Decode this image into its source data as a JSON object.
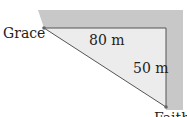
{
  "diagram": {
    "labels": {
      "top_left": "Grace",
      "top_side": "80 m",
      "right_side": "50 m",
      "bottom_right": "Faith"
    },
    "colors": {
      "border_band": "#c8c8c8",
      "triangle_fill": "#ececec",
      "line": "#555555"
    }
  }
}
